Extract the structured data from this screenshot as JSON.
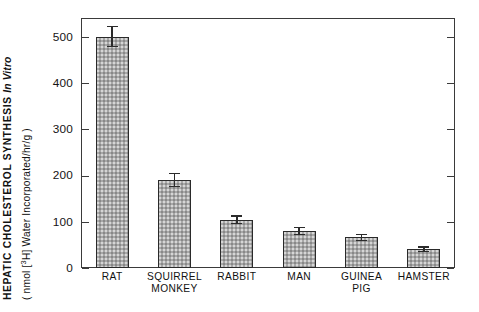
{
  "chart_data": {
    "type": "bar",
    "title": "",
    "ylabel_line1": "HEPATIC CHOLESTEROL SYNTHESIS In Vitro",
    "ylabel_line2": "( nmol [3H] Water Incorporated/hr/g )",
    "ylabel_line1_plain": "HEPATIC CHOLESTEROL SYNTHESIS",
    "ylabel_line1_italic": "In Vitro",
    "ylabel_line2_prefix": "( nmol [",
    "ylabel_line2_sup": "3",
    "ylabel_line2_suffix": "H] Water Incorporated/hr/g )",
    "xlabel": "",
    "categories": [
      "RAT",
      "SQUIRREL MONKEY",
      "RABBIT",
      "MAN",
      "GUINEA PIG",
      "HAMSTER"
    ],
    "category_lines": [
      [
        "RAT"
      ],
      [
        "SQUIRREL",
        "MONKEY"
      ],
      [
        "RABBIT"
      ],
      [
        "MAN"
      ],
      [
        "GUINEA",
        "PIG"
      ],
      [
        "HAMSTER"
      ]
    ],
    "values": [
      500,
      190,
      104,
      80,
      66,
      40
    ],
    "errors": [
      22,
      14,
      8,
      7,
      6,
      5
    ],
    "ylim": [
      0,
      540
    ],
    "yticks": [
      0,
      100,
      200,
      300,
      400,
      500
    ],
    "ytick_labels": [
      "0",
      "100",
      "200",
      "300",
      "400",
      "500"
    ],
    "grid": false,
    "legend": false,
    "bar_color": "#a8a8a8",
    "bar_edge_color": "#2a2a2a",
    "axis_color": "#3a3a3a",
    "error_bar_color": "#2b2b2b",
    "background": "#ffffff"
  }
}
